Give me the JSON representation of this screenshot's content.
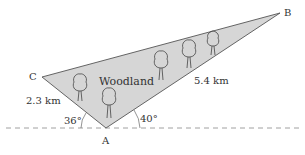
{
  "diagram": {
    "region_label": "Woodland",
    "fill_color": "#d6d6d6",
    "stroke_color": "#555555",
    "vertices": {
      "A": {
        "label": "A",
        "x": 106,
        "y": 128
      },
      "B": {
        "label": "B",
        "x": 280,
        "y": 13
      },
      "C": {
        "label": "C",
        "x": 42,
        "y": 77
      }
    },
    "sides": {
      "AC": {
        "label": "2.3 km"
      },
      "AB": {
        "label": "5.4 km"
      }
    },
    "angles": {
      "left": {
        "label": "36°"
      },
      "right": {
        "label": "40°"
      }
    },
    "tree_count": 5
  }
}
